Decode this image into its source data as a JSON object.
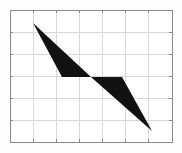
{
  "figure": {
    "background_color": "#fdfdfd",
    "width": 182,
    "height": 153
  },
  "chart_data": {
    "type": "scatter",
    "title": "",
    "subtitle": "",
    "xlabel": "",
    "ylabel": "",
    "legend": [],
    "annotations": [],
    "grid": true,
    "grid_color": "#d8d8d8",
    "axis_color": "#8a8a8a",
    "tick_labels_x": [],
    "tick_labels_y": [],
    "xlim": [
      0,
      7
    ],
    "ylim": [
      0,
      6
    ],
    "plot_area": {
      "left": 10,
      "top": 10,
      "right": 172,
      "bottom": 142,
      "columns": 7,
      "rows": 6
    },
    "x_gridlines": [
      33.1,
      56.2,
      79.3,
      102.4,
      125.6,
      148.7
    ],
    "y_gridlines": [
      32,
      54,
      76,
      98,
      120
    ],
    "shapes": [
      {
        "name": "upper-left-dart",
        "fill": "#111111",
        "points": "33,23 91,77 62,77"
      },
      {
        "name": "lower-right-dart",
        "fill": "#111111",
        "points": "91,77 122,77 152,131"
      }
    ]
  }
}
